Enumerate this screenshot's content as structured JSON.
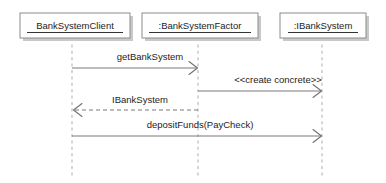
{
  "diagram": {
    "kind": "uml-sequence-diagram",
    "canvas": {
      "width": 386,
      "height": 183,
      "background": "#ffffff"
    },
    "colors": {
      "box_fill": "#fefefe",
      "box_stroke": "#8c8c8c",
      "box_shadow": "#c9c9c9",
      "lifeline": "#b4b4b4",
      "message_line": "#7b7b7b",
      "text": "#1d1d1d"
    },
    "participants": [
      {
        "id": "client",
        "label": "BankSystemClient",
        "underlined": true,
        "box": {
          "x": 20,
          "y": 13,
          "width": 110,
          "height": 25
        },
        "lifeline_x": 72,
        "lifeline_top": 38,
        "lifeline_bottom": 178
      },
      {
        "id": "factory",
        "label": ":BankSystemFactor",
        "underlined": true,
        "box": {
          "x": 142,
          "y": 13,
          "width": 116,
          "height": 25
        },
        "lifeline_x": 198,
        "lifeline_top": 38,
        "lifeline_bottom": 178
      },
      {
        "id": "ibanksystem",
        "label": ":IBankSystem",
        "underlined": true,
        "box": {
          "x": 280,
          "y": 13,
          "width": 86,
          "height": 25
        },
        "lifeline_x": 322,
        "lifeline_top": 38,
        "lifeline_bottom": 178
      }
    ],
    "messages": [
      {
        "id": "msg-get-bank-system",
        "label": "getBankSystem",
        "from": "client",
        "to": "factory",
        "style": "solid",
        "direction": "right",
        "y": 68,
        "x_start": 72,
        "x_end": 197,
        "label_x": 150,
        "label_y": 57
      },
      {
        "id": "msg-create-concrete",
        "label": "<<create concrete>>",
        "from": "factory",
        "to": "ibanksystem",
        "style": "solid",
        "direction": "right",
        "y": 91,
        "x_start": 198,
        "x_end": 321,
        "label_x": 278,
        "label_y": 80
      },
      {
        "id": "msg-return-ibanksystem",
        "label": "IBankSystem",
        "from": "factory",
        "to": "client",
        "style": "dashed",
        "direction": "left",
        "y": 110,
        "x_start": 198,
        "x_end": 73,
        "label_x": 140,
        "label_y": 100
      },
      {
        "id": "msg-deposit-funds",
        "label": "depositFunds(PayCheck)",
        "from": "client",
        "to": "ibanksystem",
        "style": "solid",
        "direction": "right",
        "y": 136,
        "x_start": 72,
        "x_end": 321,
        "label_x": 200,
        "label_y": 125
      }
    ]
  }
}
